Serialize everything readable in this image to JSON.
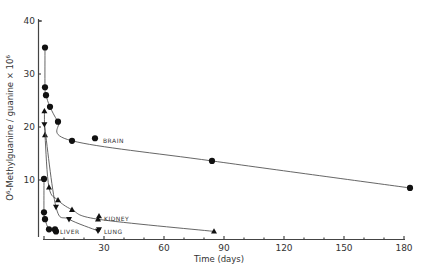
{
  "chart_data": {
    "type": "line",
    "title": "",
    "xlabel": "Time (days)",
    "ylabel": "O6-Methylguanine / guanine x 10^6",
    "ylabel_display": "O⁶-Methylguanine / guanine × 10⁶",
    "xlim": [
      0,
      180
    ],
    "ylim": [
      0,
      40
    ],
    "x_ticks": [
      0,
      30,
      60,
      90,
      120,
      150,
      180
    ],
    "x_tick_labels": [
      "30",
      "60",
      "90",
      "120",
      "150",
      "180"
    ],
    "y_ticks": [
      10,
      20,
      30,
      40
    ],
    "y_tick_labels": [
      "10",
      "20",
      "30",
      "40"
    ],
    "grid": false,
    "legend": "inline labels next to curves",
    "series": [
      {
        "name": "BRAIN",
        "marker": "circle",
        "x": [
          0.5,
          0.5,
          1,
          3,
          7,
          14,
          84,
          183
        ],
        "y": [
          35,
          27.5,
          26,
          23.8,
          21,
          17.4,
          13.6,
          8.5
        ],
        "label_pos": {
          "x": 28,
          "y": 17.5
        }
      },
      {
        "name": "KIDNEY",
        "marker": "triangle-up",
        "x": [
          0.2,
          0.5,
          2.5,
          7,
          14,
          27,
          85
        ],
        "y": [
          23,
          18.5,
          8.6,
          6.2,
          4.4,
          2.6,
          0.3
        ],
        "label_pos": {
          "x": 30,
          "y": 2.8
        }
      },
      {
        "name": "LUNG",
        "marker": "triangle-down",
        "x": [
          0.2,
          6,
          12.5,
          27
        ],
        "y": [
          20.5,
          4.9,
          2.6,
          0.4
        ],
        "label_pos": {
          "x": 30,
          "y": 0.3
        }
      },
      {
        "name": "LIVER",
        "marker": "circle",
        "x": [
          0,
          0,
          0.5,
          2.5,
          6
        ],
        "y": [
          10.2,
          3.9,
          2.6,
          0.7,
          0.3
        ],
        "label_pos": {
          "x": 8,
          "y": 0.3
        }
      }
    ]
  },
  "labels": {
    "brain": "BRAIN",
    "kidney": "KIDNEY",
    "lung": "LUNG",
    "liver": "LIVER",
    "xlabel": "Time (days)",
    "ylabel": "O⁶-Methylguanine / guanine × 10⁶"
  }
}
